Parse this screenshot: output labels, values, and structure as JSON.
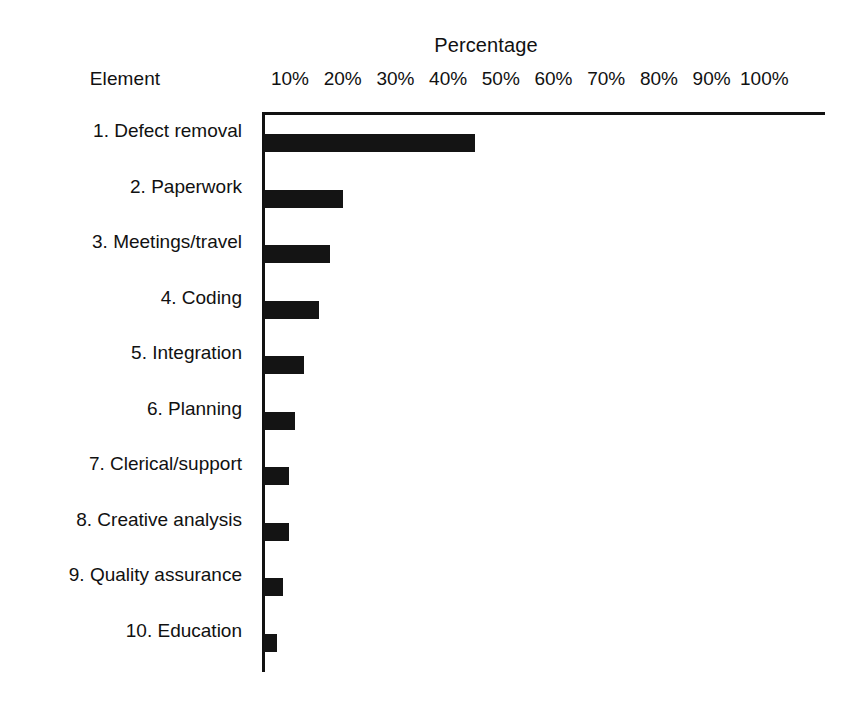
{
  "chart_data": {
    "type": "bar",
    "orientation": "horizontal",
    "title": "",
    "xlabel": "Percentage",
    "ylabel": "Element",
    "xlim": [
      0,
      100
    ],
    "grid": false,
    "legend": null,
    "xtick_labels": [
      "10%",
      "20%",
      "30%",
      "40%",
      "50%",
      "60%",
      "70%",
      "80%",
      "90%",
      "100%"
    ],
    "xtick_values": [
      10,
      20,
      30,
      40,
      50,
      60,
      70,
      80,
      90,
      100
    ],
    "categories": [
      "1. Defect removal",
      "2. Paperwork",
      "3. Meetings/travel",
      "4. Coding",
      "5. Integration",
      "6. Planning",
      "7. Clerical/support",
      "8. Creative analysis",
      "9. Quality assurance",
      "10. Education"
    ],
    "values": [
      40,
      15,
      12.5,
      10.5,
      7.5,
      5.8,
      4.7,
      4.7,
      3.6,
      2.5
    ],
    "bar_color": "#141414",
    "axis_color": "#111111",
    "background_color": "#ffffff"
  },
  "headers": {
    "element": "Element",
    "percentage": "Percentage"
  },
  "ticks": [
    {
      "label": "10%",
      "value": 10
    },
    {
      "label": "20%",
      "value": 20
    },
    {
      "label": "30%",
      "value": 30
    },
    {
      "label": "40%",
      "value": 40
    },
    {
      "label": "50%",
      "value": 50
    },
    {
      "label": "60%",
      "value": 60
    },
    {
      "label": "70%",
      "value": 70
    },
    {
      "label": "80%",
      "value": 80
    },
    {
      "label": "90%",
      "value": 90
    },
    {
      "label": "100%",
      "value": 100
    }
  ],
  "rows": [
    {
      "label": "1. Defect removal",
      "value": 40
    },
    {
      "label": "2. Paperwork",
      "value": 15
    },
    {
      "label": "3. Meetings/travel",
      "value": 12.5
    },
    {
      "label": "4. Coding",
      "value": 10.5
    },
    {
      "label": "5. Integration",
      "value": 7.5
    },
    {
      "label": "6. Planning",
      "value": 5.8
    },
    {
      "label": "7. Clerical/support",
      "value": 4.7
    },
    {
      "label": "8. Creative analysis",
      "value": 4.7
    },
    {
      "label": "9. Quality assurance",
      "value": 3.6
    },
    {
      "label": "10. Education",
      "value": 2.5
    }
  ]
}
